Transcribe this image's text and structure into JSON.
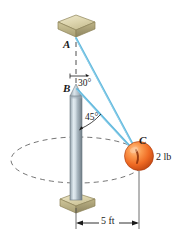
{
  "figure": {
    "type": "engineering-mechanics-diagram",
    "points": {
      "A": {
        "label": "A",
        "x": 76,
        "y": 38,
        "role": "upper-cord-attachment"
      },
      "B": {
        "label": "B",
        "x": 76,
        "y": 90,
        "role": "lower-cord-attachment-pole-tip"
      },
      "C": {
        "label": "C",
        "x": 139,
        "y": 155,
        "role": "ball-center"
      }
    },
    "angles": [
      {
        "name": "angle-at-A",
        "value": "30°",
        "between": "vertical-dashed-axis and cord AC"
      },
      {
        "name": "angle-at-B",
        "value": "45°",
        "between": "pole axis and cord BC"
      }
    ],
    "weight": {
      "label": "2 lb",
      "applies_to": "C"
    },
    "dimension": {
      "label": "5 ft",
      "from": "pole-axis",
      "to": "ball-C-vertical"
    },
    "members": [
      {
        "name": "cord-AC",
        "from": "A",
        "to": "C"
      },
      {
        "name": "cord-BC",
        "from": "B",
        "to": "C"
      }
    ],
    "colors": {
      "cord": "#63b9dd",
      "ball": "#ee6a2a",
      "pole": "#b8c4cc",
      "block": "#cfc69a",
      "dashed": "#4a4a4a",
      "text": "#1a1a1a"
    }
  }
}
